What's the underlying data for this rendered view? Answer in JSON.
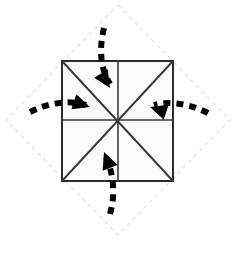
{
  "figure": {
    "canvas": {
      "width": 235,
      "height": 258,
      "background": "#ffffff"
    },
    "colors": {
      "outline": "#2b2b2b",
      "crease": "#3a3a3a",
      "panel_fill": "#fafafa",
      "guide_dashed": "#cfcfcf",
      "arrow": "#000000"
    },
    "guide_diamond": {
      "label": "paper-outline-diamond",
      "style": "dashed",
      "stroke": "#cfcfcf",
      "stroke_width": 1,
      "dash": "4 4",
      "points": [
        {
          "x": 118,
          "y": 5
        },
        {
          "x": 230,
          "y": 120
        },
        {
          "x": 118,
          "y": 235
        },
        {
          "x": 6,
          "y": 120
        }
      ]
    },
    "square": {
      "label": "folded-square",
      "stroke": "#2b2b2b",
      "stroke_width": 2,
      "fill": "#fafafa",
      "left": 62,
      "top": 61,
      "right": 173,
      "bottom": 181,
      "center": {
        "x": 118,
        "y": 120
      }
    },
    "creases": [
      {
        "name": "crease-diagonal-tl-br",
        "x1": 62,
        "y1": 61,
        "x2": 173,
        "y2": 181
      },
      {
        "name": "crease-diagonal-tr-bl",
        "x1": 173,
        "y1": 61,
        "x2": 62,
        "y2": 181
      },
      {
        "name": "crease-horizontal-mid",
        "x1": 62,
        "y1": 120,
        "x2": 173,
        "y2": 120
      },
      {
        "name": "crease-vertical-mid",
        "x1": 118,
        "y1": 61,
        "x2": 118,
        "y2": 181
      }
    ],
    "arrows": [
      {
        "name": "arrow-fold-top",
        "direction": "down-right",
        "path": "M 104 28 C 99 48 100 68 110 84",
        "head": {
          "x": 110,
          "y": 88,
          "angle": 58
        }
      },
      {
        "name": "arrow-fold-left",
        "direction": "right",
        "path": "M 30 112 C 50 102 70 100 86 105",
        "head": {
          "x": 90,
          "y": 107,
          "angle": 18
        }
      },
      {
        "name": "arrow-fold-right",
        "direction": "left",
        "path": "M 208 113 C 188 103 168 101 154 105",
        "head": {
          "x": 150,
          "y": 107,
          "angle": 198
        }
      },
      {
        "name": "arrow-fold-bottom",
        "direction": "up-left",
        "path": "M 110 214 C 116 194 113 172 106 157",
        "head": {
          "x": 104,
          "y": 152,
          "angle": 249
        }
      }
    ]
  }
}
